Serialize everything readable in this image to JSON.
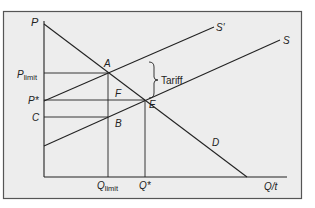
{
  "diagram": {
    "colors": {
      "background": "#ededed",
      "frame": "#555555",
      "line": "#222222",
      "text": "#222222"
    },
    "axes": {
      "y_label": "P",
      "x_label": "Q/t"
    },
    "curves": {
      "demand": "D",
      "supply": "S",
      "supply_with_tariff": "S′"
    },
    "points": {
      "A": "A",
      "B": "B",
      "E": "E",
      "F": "F"
    },
    "price_labels": {
      "p_limit_main": "P",
      "p_limit_sub": "limit",
      "p_star": "P*",
      "c": "C"
    },
    "quantity_labels": {
      "q_limit_main": "Q",
      "q_limit_sub": "limit",
      "q_star": "Q*"
    },
    "annotation": {
      "tariff": "Tariff"
    }
  }
}
